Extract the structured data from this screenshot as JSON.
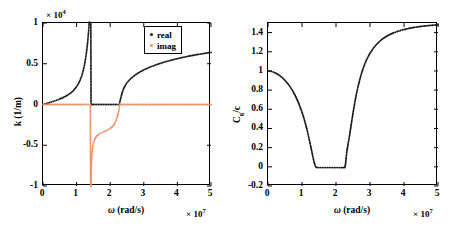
{
  "figure": {
    "background": "#ffffff",
    "panels": [
      "dispersion-k",
      "group-velocity"
    ]
  },
  "chart_data": [
    {
      "id": "left",
      "type": "scatter",
      "title": "",
      "xlabel": "ω (rad/s)",
      "ylabel": "k (1/m)",
      "x_exponent": "× 10",
      "x_exponent_power": "7",
      "y_exponent": "× 10",
      "y_exponent_power": "4",
      "xlim": [
        0,
        5
      ],
      "ylim": [
        -1,
        1
      ],
      "xticks": [
        "0",
        "1",
        "2",
        "3",
        "4",
        "5"
      ],
      "yticks": [
        "1",
        "0.5",
        "0",
        "-0.5",
        "-1"
      ],
      "grid": false,
      "legend_position": "top-right",
      "series": [
        {
          "name": "real",
          "color": "#1a1a1a",
          "marker": "dot",
          "comment": "lower passband 0->1.42e7 diverges upward; flat zero across bandgap; upper passband from 2.28e7 rising",
          "x": [
            0.0,
            0.1,
            0.2,
            0.3,
            0.4,
            0.5,
            0.6,
            0.7,
            0.8,
            0.9,
            1.0,
            1.05,
            1.1,
            1.15,
            1.2,
            1.24,
            1.27,
            1.3,
            1.32,
            1.34,
            1.36,
            1.37,
            1.38,
            1.385,
            1.39,
            1.395,
            1.4,
            1.405,
            1.41,
            1.415,
            1.42,
            1.43,
            1.5,
            1.6,
            1.7,
            1.8,
            1.9,
            2.0,
            2.1,
            2.2,
            2.26,
            2.28,
            2.3,
            2.33,
            2.36,
            2.4,
            2.45,
            2.5,
            2.6,
            2.7,
            2.8,
            2.9,
            3.0,
            3.2,
            3.4,
            3.6,
            3.8,
            4.0,
            4.2,
            4.4,
            4.6,
            4.8,
            5.0
          ],
          "y": [
            0.0,
            0.012,
            0.025,
            0.038,
            0.052,
            0.068,
            0.086,
            0.107,
            0.133,
            0.168,
            0.22,
            0.253,
            0.295,
            0.348,
            0.42,
            0.497,
            0.57,
            0.66,
            0.73,
            0.815,
            0.91,
            0.965,
            1.01,
            1.04,
            1.07,
            1.11,
            1.155,
            1.21,
            1.28,
            1.37,
            1.48,
            0.0,
            0.0,
            0.0,
            0.0,
            0.0,
            0.0,
            0.0,
            0.0,
            0.0,
            0.0,
            0.02,
            0.055,
            0.105,
            0.15,
            0.195,
            0.235,
            0.268,
            0.313,
            0.348,
            0.378,
            0.403,
            0.425,
            0.462,
            0.492,
            0.519,
            0.542,
            0.563,
            0.582,
            0.598,
            0.613,
            0.627,
            0.64
          ]
        },
        {
          "name": "imag",
          "color": "#ec8f64",
          "marker": "dot",
          "comment": "zero everywhere in passbands; negative branch inside bandgap 1.42e7->2.28e7",
          "x": [
            0.0,
            0.25,
            0.5,
            0.75,
            1.0,
            1.2,
            1.35,
            1.41,
            1.42,
            1.425,
            1.43,
            1.435,
            1.44,
            1.45,
            1.46,
            1.48,
            1.5,
            1.53,
            1.56,
            1.6,
            1.65,
            1.7,
            1.75,
            1.8,
            1.85,
            1.9,
            1.95,
            2.0,
            2.05,
            2.1,
            2.14,
            2.18,
            2.21,
            2.24,
            2.26,
            2.275,
            2.285,
            2.3,
            2.6,
            3.0,
            3.5,
            4.0,
            4.5,
            5.0
          ],
          "y": [
            0.0,
            0.0,
            0.0,
            0.0,
            0.0,
            0.0,
            0.0,
            0.0,
            -1.18,
            -1.0,
            -0.87,
            -0.79,
            -0.73,
            -0.65,
            -0.592,
            -0.52,
            -0.478,
            -0.437,
            -0.41,
            -0.387,
            -0.368,
            -0.355,
            -0.345,
            -0.336,
            -0.327,
            -0.318,
            -0.307,
            -0.294,
            -0.277,
            -0.254,
            -0.227,
            -0.19,
            -0.15,
            -0.103,
            -0.065,
            -0.025,
            0.0,
            0.0,
            0.0,
            0.0,
            0.0,
            0.0,
            0.0,
            0.0
          ]
        }
      ],
      "legend": [
        {
          "label": "real",
          "color": "#1a1a1a"
        },
        {
          "label": "imag",
          "color": "#ec8f64"
        }
      ]
    },
    {
      "id": "right",
      "type": "scatter",
      "title": "",
      "xlabel": "ω (rad/s)",
      "ylabel": "C_g/c",
      "ylabel_main": "C",
      "ylabel_sub": "g",
      "ylabel_tail": "/c",
      "x_exponent": "× 10",
      "x_exponent_power": "7",
      "xlim": [
        0,
        5
      ],
      "ylim": [
        -0.2,
        1.5
      ],
      "xticks": [
        "0",
        "1",
        "2",
        "3",
        "4",
        "5"
      ],
      "yticks": [
        "1.4",
        "1.2",
        "1",
        "0.8",
        "0.6",
        "0.4",
        "0.2",
        "0",
        "-0.2"
      ],
      "grid": false,
      "legend_position": "none",
      "series": [
        {
          "name": "Cg/c",
          "color": "#111111",
          "marker": "dot",
          "comment": "starts at 1.0, dips to 0 in bandgap, jumps and rises to ~1.48",
          "x": [
            0.0,
            0.1,
            0.2,
            0.3,
            0.4,
            0.5,
            0.6,
            0.7,
            0.8,
            0.9,
            1.0,
            1.05,
            1.1,
            1.15,
            1.2,
            1.25,
            1.3,
            1.33,
            1.36,
            1.38,
            1.4,
            1.42,
            1.45,
            1.55,
            1.65,
            1.75,
            1.85,
            1.95,
            2.05,
            2.15,
            2.22,
            2.26,
            2.28,
            2.3,
            2.32,
            2.34,
            2.36,
            2.38,
            2.4,
            2.43,
            2.46,
            2.5,
            2.55,
            2.6,
            2.65,
            2.7,
            2.75,
            2.8,
            2.9,
            3.0,
            3.1,
            3.2,
            3.3,
            3.4,
            3.5,
            3.6,
            3.7,
            3.8,
            3.9,
            4.0,
            4.2,
            4.4,
            4.6,
            4.8,
            5.0
          ],
          "y": [
            1.0,
            0.995,
            0.982,
            0.963,
            0.936,
            0.902,
            0.86,
            0.808,
            0.744,
            0.666,
            0.57,
            0.515,
            0.452,
            0.383,
            0.305,
            0.224,
            0.14,
            0.09,
            0.045,
            0.02,
            0.004,
            -0.005,
            -0.008,
            -0.008,
            -0.008,
            -0.008,
            -0.008,
            -0.008,
            -0.008,
            -0.008,
            -0.008,
            -0.008,
            0.03,
            0.1,
            0.165,
            0.205,
            0.25,
            0.285,
            0.33,
            0.4,
            0.47,
            0.56,
            0.665,
            0.76,
            0.84,
            0.91,
            0.975,
            1.03,
            1.118,
            1.185,
            1.238,
            1.28,
            1.314,
            1.342,
            1.364,
            1.383,
            1.398,
            1.411,
            1.422,
            1.432,
            1.448,
            1.46,
            1.469,
            1.476,
            1.481
          ]
        }
      ]
    }
  ]
}
